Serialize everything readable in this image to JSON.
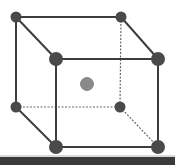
{
  "diagram": {
    "background": "#ffffff",
    "edge_color": "#3d3d3d",
    "hidden_edge_color": "#6a6a6a",
    "corner_atom_color": "#4a4a4a",
    "center_atom_color": "#8a8a8a",
    "center_atom_stroke": "#777777",
    "vertices": {
      "back_top_left": {
        "x": 16,
        "y": 17,
        "r": 5.5
      },
      "back_top_right": {
        "x": 121,
        "y": 17,
        "r": 5.5
      },
      "front_top_left": {
        "x": 56,
        "y": 59,
        "r": 7
      },
      "front_top_right": {
        "x": 158,
        "y": 59,
        "r": 7
      },
      "back_bottom_left": {
        "x": 16,
        "y": 107,
        "r": 5.5
      },
      "back_bottom_right": {
        "x": 120,
        "y": 107,
        "r": 5.5
      },
      "front_bottom_left": {
        "x": 56,
        "y": 147,
        "r": 7
      },
      "front_bottom_right": {
        "x": 158,
        "y": 147,
        "r": 7
      }
    },
    "center_atom": {
      "x": 87,
      "y": 84,
      "r": 6.5
    },
    "solid_edges": [
      [
        "back_top_left",
        "back_top_right"
      ],
      [
        "back_top_left",
        "front_top_left"
      ],
      [
        "back_top_right",
        "front_top_right"
      ],
      [
        "front_top_left",
        "front_top_right"
      ],
      [
        "back_top_left",
        "back_bottom_left"
      ],
      [
        "front_top_left",
        "front_bottom_left"
      ],
      [
        "front_top_right",
        "front_bottom_right"
      ],
      [
        "back_bottom_left",
        "front_bottom_left"
      ],
      [
        "front_bottom_left",
        "front_bottom_right"
      ]
    ],
    "hidden_edges": [
      [
        "back_top_right",
        "back_bottom_right"
      ],
      [
        "back_bottom_left",
        "back_bottom_right"
      ],
      [
        "back_bottom_right",
        "front_bottom_right"
      ]
    ]
  }
}
